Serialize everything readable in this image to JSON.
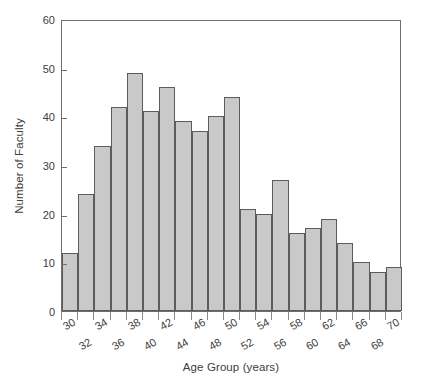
{
  "chart_data": {
    "type": "bar",
    "title": "",
    "xlabel": "Age Group (years)",
    "ylabel": "Number of Faculty",
    "categories": [
      "30",
      "32",
      "34",
      "36",
      "38",
      "40",
      "42",
      "44",
      "46",
      "48",
      "50",
      "52",
      "54",
      "56",
      "58",
      "60",
      "62",
      "64",
      "66",
      "68",
      "70"
    ],
    "values": [
      12,
      24,
      34,
      42,
      49,
      41,
      46,
      39,
      37,
      40,
      44,
      21,
      20,
      27,
      16,
      17,
      19,
      14,
      10,
      8,
      9
    ],
    "ylim": [
      0,
      60
    ],
    "yticks": [
      0,
      10,
      20,
      30,
      40,
      50,
      60
    ],
    "xlim": [
      29,
      71
    ],
    "bin_width": 2,
    "grid": false,
    "legend": null,
    "bar_color": "#c9c9c9",
    "bar_edge_color": "#5c5c5c",
    "frame_color": "#6e6e6e",
    "text_color": "#3d3d3d",
    "background": "#ffffff"
  },
  "axes": {
    "y_title": "Number of Faculty",
    "x_title": "Age Group (years)",
    "y_tick_labels": [
      "0",
      "10",
      "20",
      "30",
      "40",
      "50",
      "60"
    ],
    "x_tick_labels": [
      "30",
      "32",
      "34",
      "36",
      "38",
      "40",
      "42",
      "44",
      "46",
      "48",
      "50",
      "52",
      "54",
      "56",
      "58",
      "60",
      "62",
      "64",
      "66",
      "68",
      "70"
    ]
  }
}
